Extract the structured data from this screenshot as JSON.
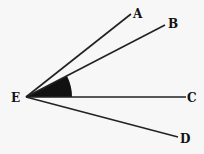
{
  "diagram": {
    "type": "angle-rays",
    "vertex": {
      "label": "E",
      "x": 26,
      "y": 97
    },
    "rays": [
      {
        "label": "A",
        "x1": 26,
        "y1": 97,
        "x2": 131,
        "y2": 14
      },
      {
        "label": "B",
        "x1": 26,
        "y1": 97,
        "x2": 165,
        "y2": 25
      },
      {
        "label": "C",
        "x1": 26,
        "y1": 97,
        "x2": 186,
        "y2": 97
      },
      {
        "label": "D",
        "x1": 26,
        "y1": 97,
        "x2": 178,
        "y2": 137
      }
    ],
    "shaded_angle": {
      "between": [
        "B",
        "C"
      ],
      "vertex": "E",
      "color": "#111111"
    },
    "labels": {
      "A": "A",
      "B": "B",
      "C": "C",
      "D": "D",
      "E": "E"
    },
    "line_color": "#222222",
    "background": "#f7f7f7"
  }
}
